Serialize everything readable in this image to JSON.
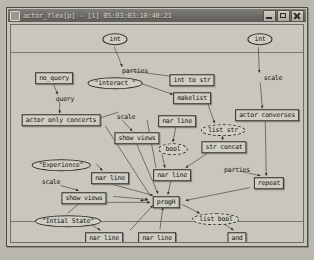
{
  "window": {
    "title": "actor_flex[p] - [1] 05:03:03:10:40:21",
    "icon": "app-icon",
    "buttons": {
      "minimize": "minimize",
      "maximize": "maximize",
      "close": "close"
    }
  },
  "graph": {
    "nodes": [
      {
        "id": "int_top_left",
        "label": "int",
        "shape": "ell",
        "x": 104,
        "y": 14
      },
      {
        "id": "int_top_right",
        "label": "int",
        "shape": "ell",
        "x": 249,
        "y": 14
      },
      {
        "id": "no_query",
        "label": "no_query",
        "shape": "box",
        "x": 43,
        "y": 53
      },
      {
        "id": "interact",
        "label": "\"interact \"",
        "shape": "ell",
        "x": 104,
        "y": 58
      },
      {
        "id": "int_to_str",
        "label": "int to str",
        "shape": "box",
        "x": 181,
        "y": 55
      },
      {
        "id": "makelist",
        "label": "makelist",
        "shape": "box",
        "x": 181,
        "y": 73
      },
      {
        "id": "actor_converses",
        "label": "actor converses",
        "shape": "box",
        "x": 256,
        "y": 90
      },
      {
        "id": "actor_only",
        "label": "actor only concerts",
        "shape": "box",
        "x": 50,
        "y": 95
      },
      {
        "id": "nar_line_1",
        "label": "nar line",
        "shape": "box",
        "x": 166,
        "y": 96
      },
      {
        "id": "list_str",
        "label": "list str",
        "shape": "ell",
        "x": 212,
        "y": 105,
        "dashed": true
      },
      {
        "id": "show_views_1",
        "label": "show views",
        "shape": "box",
        "x": 126,
        "y": 113
      },
      {
        "id": "bool_mid",
        "label": "bool",
        "shape": "ell",
        "x": 162,
        "y": 124,
        "dashed": true
      },
      {
        "id": "str_concat",
        "label": "str concat",
        "shape": "box",
        "x": 213,
        "y": 122
      },
      {
        "id": "experience",
        "label": "\"Experience\"",
        "shape": "ell",
        "x": 50,
        "y": 140
      },
      {
        "id": "nar_line_2",
        "label": "nar line",
        "shape": "box",
        "x": 99,
        "y": 153
      },
      {
        "id": "nar_line_3",
        "label": "nar line",
        "shape": "box",
        "x": 161,
        "y": 150
      },
      {
        "id": "repeat",
        "label": "repeat",
        "shape": "box",
        "x": 258,
        "y": 158
      },
      {
        "id": "show_views_2",
        "label": "show views",
        "shape": "box",
        "x": 73,
        "y": 173
      },
      {
        "id": "progH",
        "label": "progH",
        "shape": "box",
        "x": 155,
        "y": 177
      },
      {
        "id": "list_bool",
        "label": "list bool",
        "shape": "ell",
        "x": 205,
        "y": 194,
        "dashed": true
      },
      {
        "id": "initial_state",
        "label": "\"Intial State\"",
        "shape": "ell",
        "x": 57,
        "y": 196
      },
      {
        "id": "and",
        "label": "and",
        "shape": "box",
        "x": 226,
        "y": 213
      },
      {
        "id": "nar_line_4",
        "label": "nar line",
        "shape": "box",
        "x": 93,
        "y": 213
      },
      {
        "id": "nar_line_5",
        "label": "nar line",
        "shape": "box",
        "x": 146,
        "y": 213
      },
      {
        "id": "bool_bottom",
        "label": "bool",
        "shape": "ell",
        "x": 227,
        "y": 240
      }
    ],
    "edge_labels": [
      {
        "id": "parties_top",
        "text": "parties",
        "x": 124,
        "y": 46
      },
      {
        "id": "scale_right",
        "text": "scale",
        "x": 262,
        "y": 53
      },
      {
        "id": "query",
        "text": "query",
        "x": 54,
        "y": 74
      },
      {
        "id": "scale_mid",
        "text": "scale",
        "x": 115,
        "y": 92
      },
      {
        "id": "scale_left",
        "text": "scale",
        "x": 40,
        "y": 157
      },
      {
        "id": "parties_low",
        "text": "parties",
        "x": 226,
        "y": 145
      }
    ],
    "edges": [
      {
        "from": [
          104,
          22
        ],
        "to": [
          112,
          42
        ],
        "arrow": true
      },
      {
        "from": [
          118,
          46
        ],
        "to": [
          163,
          52
        ],
        "arrow": true
      },
      {
        "from": [
          128,
          58
        ],
        "to": [
          163,
          70
        ],
        "arrow": true
      },
      {
        "from": [
          249,
          22
        ],
        "to": [
          250,
          48
        ],
        "arrow": true
      },
      {
        "from": [
          251,
          58
        ],
        "to": [
          253,
          84
        ],
        "arrow": true
      },
      {
        "from": [
          43,
          60
        ],
        "to": [
          47,
          70
        ],
        "arrow": true
      },
      {
        "from": [
          49,
          78
        ],
        "to": [
          49,
          89
        ],
        "arrow": true
      },
      {
        "from": [
          86,
          95
        ],
        "to": [
          108,
          88
        ],
        "arrow": false
      },
      {
        "from": [
          112,
          96
        ],
        "to": [
          122,
          107
        ],
        "arrow": true
      },
      {
        "from": [
          196,
          73
        ],
        "to": [
          205,
          99
        ],
        "arrow": true
      },
      {
        "from": [
          213,
          111
        ],
        "to": [
          213,
          116
        ],
        "arrow": true
      },
      {
        "from": [
          166,
          103
        ],
        "to": [
          163,
          118
        ],
        "arrow": true
      },
      {
        "from": [
          200,
          128
        ],
        "to": [
          176,
          144
        ],
        "arrow": true
      },
      {
        "from": [
          152,
          130
        ],
        "to": [
          155,
          144
        ],
        "arrow": true
      },
      {
        "from": [
          256,
          97
        ],
        "to": [
          257,
          152
        ],
        "arrow": true
      },
      {
        "from": [
          232,
          148
        ],
        "to": [
          251,
          152
        ],
        "arrow": true
      },
      {
        "from": [
          86,
          140
        ],
        "to": [
          92,
          147
        ],
        "arrow": true
      },
      {
        "from": [
          50,
          162
        ],
        "to": [
          68,
          167
        ],
        "arrow": true
      },
      {
        "from": [
          99,
          160
        ],
        "to": [
          143,
          172
        ],
        "arrow": true
      },
      {
        "from": [
          161,
          157
        ],
        "to": [
          158,
          171
        ],
        "arrow": true
      },
      {
        "from": [
          103,
          173
        ],
        "to": [
          138,
          176
        ],
        "arrow": true
      },
      {
        "from": [
          57,
          190
        ],
        "to": [
          70,
          179
        ],
        "arrow": false
      },
      {
        "from": [
          120,
          207
        ],
        "to": [
          143,
          182
        ],
        "arrow": true
      },
      {
        "from": [
          150,
          206
        ],
        "to": [
          153,
          184
        ],
        "arrow": true
      },
      {
        "from": [
          172,
          181
        ],
        "to": [
          190,
          190
        ],
        "arrow": true
      },
      {
        "from": [
          213,
          200
        ],
        "to": [
          224,
          207
        ],
        "arrow": true
      },
      {
        "from": [
          226,
          219
        ],
        "to": [
          227,
          233
        ],
        "arrow": true
      },
      {
        "from": [
          241,
          164
        ],
        "to": [
          176,
          177
        ],
        "arrow": true
      },
      {
        "from": [
          138,
          177
        ],
        "to": [
          130,
          177
        ],
        "arrow": true
      },
      {
        "from": [
          126,
          119
        ],
        "to": [
          148,
          170
        ],
        "arrow": true
      },
      {
        "from": [
          73,
          179
        ],
        "to": [
          140,
          179
        ],
        "arrow": true
      },
      {
        "from": [
          71,
          196
        ],
        "to": [
          90,
          207
        ],
        "arrow": true
      },
      {
        "from": [
          137,
          96
        ],
        "to": [
          146,
          144
        ],
        "arrow": false
      },
      {
        "from": [
          95,
          102
        ],
        "to": [
          140,
          172
        ],
        "arrow": false
      }
    ]
  }
}
